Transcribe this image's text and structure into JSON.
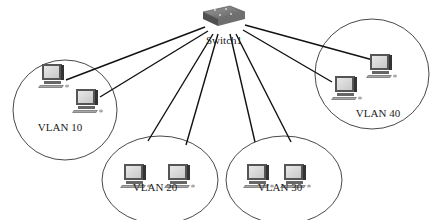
{
  "diagram": {
    "switch": {
      "label": "Switch1",
      "x": 220,
      "y": 14
    },
    "vlans": [
      {
        "label": "VLAN 10",
        "cx": 65,
        "cy": 110,
        "rx": 52,
        "ry": 50,
        "label_x": 60,
        "label_y": 131,
        "pcs": [
          {
            "x": 52,
            "y": 78
          },
          {
            "x": 86,
            "y": 103
          }
        ]
      },
      {
        "label": "VLAN 20",
        "cx": 160,
        "cy": 180,
        "rx": 58,
        "ry": 44,
        "label_x": 155,
        "label_y": 191,
        "pcs": [
          {
            "x": 134,
            "y": 178
          },
          {
            "x": 178,
            "y": 178
          }
        ]
      },
      {
        "label": "VLAN 30",
        "cx": 284,
        "cy": 180,
        "rx": 58,
        "ry": 44,
        "label_x": 280,
        "label_y": 191,
        "pcs": [
          {
            "x": 257,
            "y": 178
          },
          {
            "x": 294,
            "y": 178
          }
        ]
      },
      {
        "label": "VLAN 40",
        "cx": 372,
        "cy": 74,
        "rx": 57,
        "ry": 55,
        "label_x": 378,
        "label_y": 117,
        "pcs": [
          {
            "x": 380,
            "y": 68
          },
          {
            "x": 345,
            "y": 90
          }
        ]
      }
    ],
    "links": [
      {
        "from": [
          205,
          27
        ],
        "to": [
          66,
          80
        ]
      },
      {
        "from": [
          208,
          31
        ],
        "to": [
          100,
          97
        ]
      },
      {
        "from": [
          213,
          34
        ],
        "to": [
          148,
          141
        ]
      },
      {
        "from": [
          218,
          34
        ],
        "to": [
          186,
          145
        ]
      },
      {
        "from": [
          230,
          34
        ],
        "to": [
          255,
          142
        ]
      },
      {
        "from": [
          236,
          34
        ],
        "to": [
          291,
          142
        ]
      },
      {
        "from": [
          243,
          30
        ],
        "to": [
          332,
          82
        ]
      },
      {
        "from": [
          245,
          25
        ],
        "to": [
          373,
          60
        ]
      }
    ]
  }
}
